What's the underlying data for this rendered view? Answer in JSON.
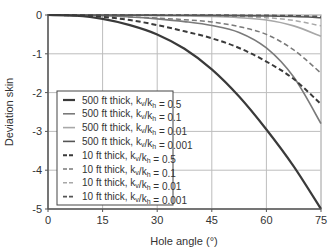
{
  "chart_data": {
    "type": "line",
    "title": "",
    "xlabel": "Hole angle (°)",
    "ylabel": "Deviation skin",
    "xlim": [
      0,
      75
    ],
    "ylim": [
      -5,
      0
    ],
    "xticks": [
      0,
      15,
      30,
      45,
      60,
      75
    ],
    "yticks": [
      0,
      -1,
      -2,
      -3,
      -4,
      -5
    ],
    "grid": true,
    "legend_position": "lower-left (inside)",
    "x": [
      0,
      7.5,
      15,
      22.5,
      30,
      37.5,
      45,
      52.5,
      60,
      67.5,
      75
    ],
    "series": [
      {
        "name": "500 ft thick, kv/kh = 0.5",
        "thickness": "500 ft",
        "ratio": "0.5",
        "style": "solid",
        "color": "#3a3a3a",
        "width": 2.2,
        "values": [
          0,
          -0.02,
          -0.1,
          -0.26,
          -0.5,
          -0.87,
          -1.4,
          -2.1,
          -2.95,
          -3.9,
          -5.0
        ]
      },
      {
        "name": "500 ft thick, kv/kh = 0.1",
        "thickness": "500 ft",
        "ratio": "0.1",
        "style": "solid",
        "color": "#7a7a7a",
        "width": 1.6,
        "values": [
          0,
          -0.005,
          -0.02,
          -0.05,
          -0.1,
          -0.17,
          -0.27,
          -0.45,
          -0.85,
          -1.6,
          -2.8
        ]
      },
      {
        "name": "500 ft thick, kv/kh = 0.01",
        "thickness": "500 ft",
        "ratio": "0.01",
        "style": "solid",
        "color": "#a8a8a8",
        "width": 1.6,
        "values": [
          0,
          -0.001,
          -0.004,
          -0.008,
          -0.015,
          -0.025,
          -0.04,
          -0.07,
          -0.13,
          -0.28,
          -0.55
        ]
      },
      {
        "name": "500 ft thick, kv/kh = 0.001",
        "thickness": "500 ft",
        "ratio": "0.001",
        "style": "solid",
        "color": "#555555",
        "width": 1.6,
        "values": [
          0,
          0,
          -0.001,
          -0.002,
          -0.004,
          -0.006,
          -0.01,
          -0.015,
          -0.025,
          -0.04,
          -0.07
        ]
      },
      {
        "name": "10 ft thick, kv/kh = 0.5",
        "thickness": "10 ft",
        "ratio": "0.5",
        "style": "dashed",
        "color": "#3a3a3a",
        "width": 2.0,
        "values": [
          0,
          -0.01,
          -0.05,
          -0.13,
          -0.26,
          -0.42,
          -0.6,
          -0.85,
          -1.2,
          -1.65,
          -2.3
        ]
      },
      {
        "name": "10 ft thick, kv/kh = 0.1",
        "thickness": "10 ft",
        "ratio": "0.1",
        "style": "dashed",
        "color": "#7a7a7a",
        "width": 1.5,
        "values": [
          0,
          -0.005,
          -0.02,
          -0.05,
          -0.08,
          -0.12,
          -0.18,
          -0.3,
          -0.5,
          -0.9,
          -1.5
        ]
      },
      {
        "name": "10 ft thick, kv/kh = 0.01",
        "thickness": "10 ft",
        "ratio": "0.01",
        "style": "dashed",
        "color": "#a8a8a8",
        "width": 1.5,
        "values": [
          0,
          -0.001,
          -0.003,
          -0.006,
          -0.01,
          -0.015,
          -0.025,
          -0.04,
          -0.07,
          -0.14,
          -0.28
        ]
      },
      {
        "name": "10 ft thick, kv/kh = 0.001",
        "thickness": "10 ft",
        "ratio": "0.001",
        "style": "dashed",
        "color": "#555555",
        "width": 1.8,
        "values": [
          0,
          0,
          0,
          -0.001,
          -0.002,
          -0.003,
          -0.005,
          -0.008,
          -0.012,
          -0.02,
          -0.04
        ]
      }
    ]
  },
  "legend": {
    "items": [
      {
        "prefix": "500 ft thick, k",
        "sub1": "v",
        "mid": "/k",
        "sub2": "h",
        "suffix": " = 0.5"
      },
      {
        "prefix": "500 ft thick, k",
        "sub1": "v",
        "mid": "/k",
        "sub2": "h",
        "suffix": " = 0.1"
      },
      {
        "prefix": "500 ft thick, k",
        "sub1": "v",
        "mid": "/k",
        "sub2": "h",
        "suffix": " = 0.01"
      },
      {
        "prefix": "500 ft thick, k",
        "sub1": "v",
        "mid": "/k",
        "sub2": "h",
        "suffix": " = 0.001"
      },
      {
        "prefix": "10 ft thick, k",
        "sub1": "v",
        "mid": "/k",
        "sub2": "h",
        "suffix": " = 0.5"
      },
      {
        "prefix": "10 ft thick, k",
        "sub1": "v",
        "mid": "/k",
        "sub2": "h",
        "suffix": " = 0.1"
      },
      {
        "prefix": "10 ft thick, k",
        "sub1": "v",
        "mid": "/k",
        "sub2": "h",
        "suffix": " = 0.01"
      },
      {
        "prefix": "10 ft thick, k",
        "sub1": "v",
        "mid": "/k",
        "sub2": "h",
        "suffix": " = 0.001"
      }
    ]
  },
  "colors": {
    "grid": "#bdbdbd",
    "axis": "#555555",
    "frame": "#c8c8c8"
  }
}
